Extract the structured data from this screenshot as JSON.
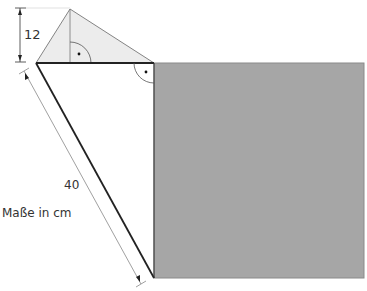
{
  "diagram": {
    "labels": {
      "height": "12",
      "hypotenuse": "40",
      "units": "Maße in cm"
    },
    "colors": {
      "square_fill": "#a6a6a6",
      "triangle_fill": "#ececec",
      "line": "#222222",
      "thin_line": "#777777"
    }
  }
}
